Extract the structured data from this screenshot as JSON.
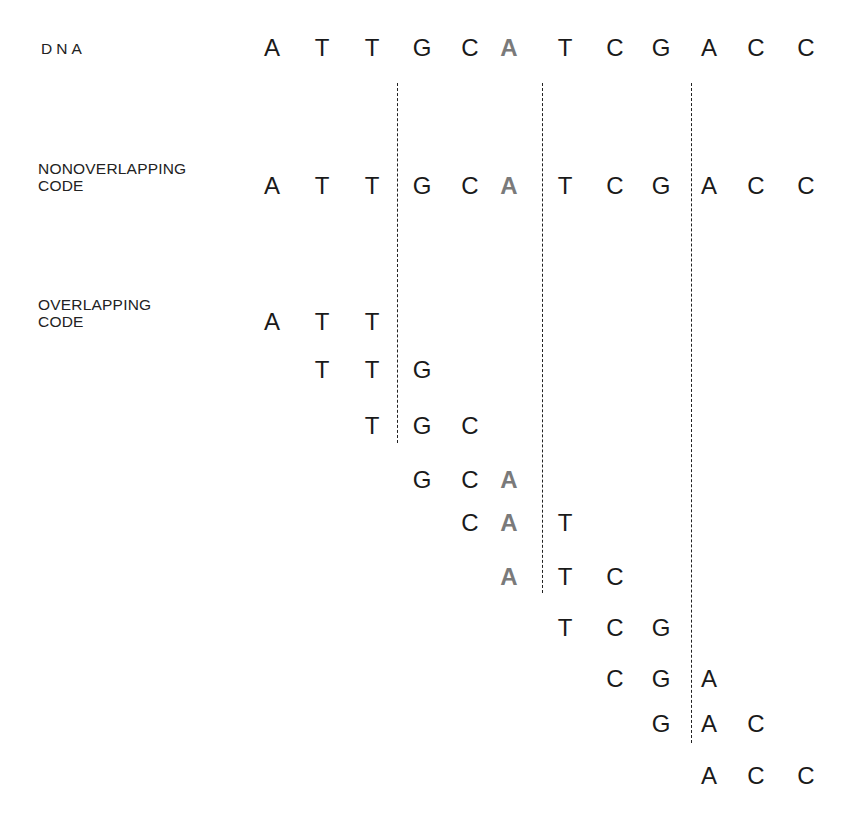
{
  "labels": {
    "dna": "DNA",
    "nonoverlapping_line1": "NONOVERLAPPING",
    "nonoverlapping_line2": "CODE",
    "overlapping_line1": "OVERLAPPING",
    "overlapping_line2": "CODE"
  },
  "colors": {
    "text": "#1a1a1a",
    "highlight": "#7a7a7a"
  },
  "sequence": [
    "A",
    "T",
    "T",
    "G",
    "C",
    "A",
    "T",
    "C",
    "G",
    "A",
    "C",
    "C"
  ],
  "highlight_index": 5,
  "dna_row": [
    "A",
    "T",
    "T",
    "G",
    "C",
    "A",
    "T",
    "C",
    "G",
    "A",
    "C",
    "C"
  ],
  "nonoverlapping_codons": [
    [
      "A",
      "T",
      "T"
    ],
    [
      "G",
      "C",
      "A"
    ],
    [
      "T",
      "C",
      "G"
    ],
    [
      "A",
      "C",
      "C"
    ]
  ],
  "overlapping_codons": [
    [
      "A",
      "T",
      "T"
    ],
    [
      "T",
      "T",
      "G"
    ],
    [
      "T",
      "G",
      "C"
    ],
    [
      "G",
      "C",
      "A"
    ],
    [
      "C",
      "A",
      "T"
    ],
    [
      "A",
      "T",
      "C"
    ],
    [
      "T",
      "C",
      "G"
    ],
    [
      "C",
      "G",
      "A"
    ],
    [
      "G",
      "A",
      "C"
    ],
    [
      "A",
      "C",
      "C"
    ]
  ]
}
